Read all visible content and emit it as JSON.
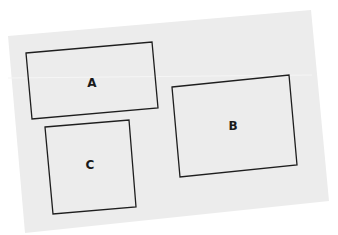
{
  "diagram": {
    "paper_color": "#ececec",
    "stroke_color": "#1e1e1e",
    "shapes": [
      {
        "id": "A",
        "label": "A"
      },
      {
        "id": "B",
        "label": "B"
      },
      {
        "id": "C",
        "label": "C"
      }
    ]
  }
}
